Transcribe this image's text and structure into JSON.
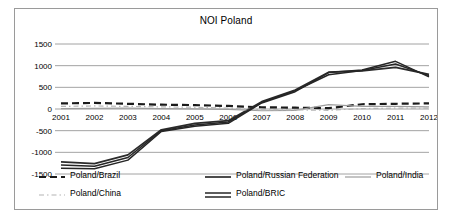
{
  "chart_data": {
    "type": "line",
    "title": "NOI Poland",
    "xlabel": "",
    "ylabel": "",
    "grid": true,
    "legend_position": "bottom",
    "ylim": [
      -1500,
      1500
    ],
    "yticks": [
      1500,
      1000,
      500,
      0,
      -500,
      -1000,
      -1500
    ],
    "ytick_labels": [
      "1500",
      "1000",
      "500",
      "0",
      "-500",
      "-1000",
      "-1500"
    ],
    "categories": [
      2001,
      2002,
      2003,
      2004,
      2005,
      2006,
      2007,
      2008,
      2009,
      2010,
      2011,
      2012
    ],
    "xtick_labels": [
      "2001",
      "2002",
      "2003",
      "2004",
      "2005",
      "2006",
      "2007",
      "2008",
      "2009",
      "2010",
      "2011",
      "2012"
    ],
    "series": [
      {
        "name": "Poland/Brazil",
        "key": "brazil",
        "color": "#1a1a1a",
        "style": "dashed",
        "width": 2.2,
        "dash": "7,4",
        "values": [
          130,
          140,
          120,
          100,
          90,
          70,
          40,
          30,
          20,
          110,
          120,
          130
        ]
      },
      {
        "name": "Poland/Russian Federation",
        "key": "russia",
        "color": "#2b2b2b",
        "style": "solid",
        "width": 1.7,
        "dash": "",
        "values": [
          -1220,
          -1260,
          -1060,
          -480,
          -330,
          -270,
          170,
          440,
          850,
          880,
          960,
          800
        ]
      },
      {
        "name": "Poland/India",
        "key": "india",
        "color": "#9d9d9d",
        "style": "solid",
        "width": 1.2,
        "dash": "",
        "values": [
          10,
          15,
          20,
          10,
          5,
          -10,
          -40,
          -30,
          100,
          60,
          60,
          50
        ]
      },
      {
        "name": "Poland/China",
        "key": "china",
        "color": "#b4b4b4",
        "style": "dotted",
        "width": 1.2,
        "dash": "5,3,1.5,3",
        "values": [
          60,
          70,
          60,
          50,
          40,
          20,
          -20,
          -20,
          -30,
          10,
          20,
          20
        ]
      },
      {
        "name": "Poland/BRIC",
        "key": "bric",
        "color": "#262626",
        "style": "double",
        "width": 1.5,
        "dash": "",
        "values": [
          -1370,
          -1380,
          -1180,
          -520,
          -400,
          -330,
          140,
          400,
          840,
          900,
          1100,
          740
        ]
      }
    ],
    "series_secondary": {
      "name": "Poland/BRIC-lower",
      "values": [
        -1290,
        -1320,
        -1120,
        -500,
        -370,
        -300,
        155,
        420,
        790,
        890,
        1040,
        770
      ]
    }
  },
  "legend": {
    "rows": [
      [
        {
          "label": "Poland/Brazil",
          "key": "brazil"
        },
        {
          "label": "Poland/Russian Federation",
          "key": "russia"
        },
        {
          "label": "Poland/India",
          "key": "india"
        }
      ],
      [
        {
          "label": "Poland/China",
          "key": "china"
        },
        {
          "label": "Poland/BRIC",
          "key": "bric"
        }
      ]
    ]
  }
}
